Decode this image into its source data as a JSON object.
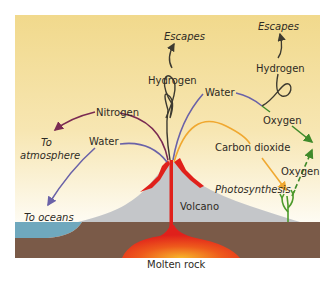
{
  "diagram": {
    "labels": {
      "escapes_left": "Escapes",
      "escapes_right": "Escapes",
      "hydrogen_left": "Hydrogen",
      "hydrogen_right": "Hydrogen",
      "water_top": "Water",
      "nitrogen": "Nitrogen",
      "to_atmosphere_1": "To",
      "to_atmosphere_2": "atmosphere",
      "water_left": "Water",
      "oxygen_top": "Oxygen",
      "carbon_dioxide": "Carbon dioxide",
      "oxygen_bottom": "Oxygen",
      "photosynthesis": "Photosynthesis",
      "to_oceans": "To oceans",
      "volcano": "Volcano",
      "molten_rock": "Molten rock"
    },
    "colors": {
      "sky_top": "#f2d98a",
      "sky_bottom": "#fdfbf3",
      "ground": "#7a5a48",
      "sea": "#6fa8bd",
      "volcano": "#c4c6c9",
      "lava": "#e0201b",
      "magma_glow": "#f5a020",
      "nitrogen_arrow": "#7a2a52",
      "water_arrow": "#6a62a8",
      "hydrogen_arrow": "#3d3a30",
      "co2_arrow": "#f0a830",
      "oxygen_arrow": "#3f8a2a"
    }
  }
}
